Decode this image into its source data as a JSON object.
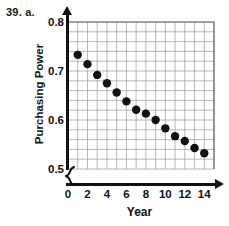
{
  "problem": {
    "label": "39. a."
  },
  "chart_data": {
    "type": "scatter",
    "title": "",
    "xlabel": "Year",
    "ylabel": "Purchasing Power",
    "xlim": [
      0,
      15
    ],
    "ylim": [
      0.5,
      0.8
    ],
    "xtick_step": 2,
    "ytick_step": 0.1,
    "grid": true,
    "grid_x_step": 1,
    "grid_y_step": 0.02,
    "axis_break_y": true,
    "legend": null,
    "xticks": [
      "0",
      "2",
      "4",
      "6",
      "8",
      "10",
      "12",
      "14"
    ],
    "xtick_values": [
      0,
      2,
      4,
      6,
      8,
      10,
      12,
      14
    ],
    "yticks": [
      "0.8",
      "0.7",
      "0.6",
      "0.5"
    ],
    "ytick_values": [
      0.8,
      0.7,
      0.6,
      0.5
    ],
    "x": [
      1,
      2,
      3,
      4,
      5,
      6,
      7,
      8,
      9,
      10,
      11,
      12,
      13,
      14
    ],
    "values": [
      0.733,
      0.714,
      0.692,
      0.675,
      0.656,
      0.638,
      0.621,
      0.613,
      0.6,
      0.583,
      0.567,
      0.557,
      0.543,
      0.532
    ],
    "marker": "circle",
    "marker_color": "#111111",
    "marker_size": 4.2,
    "grid_color": "#9a9a9a",
    "axis_color": "#111111",
    "background": "#ffffff"
  }
}
